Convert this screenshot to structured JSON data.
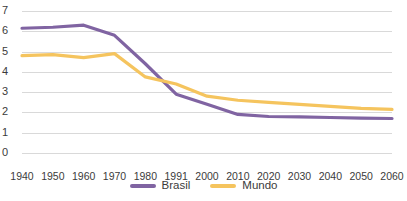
{
  "chart_data": {
    "type": "line",
    "title": "",
    "xlabel": "",
    "ylabel": "",
    "x": [
      "1940",
      "1950",
      "1960",
      "1970",
      "1980",
      "1991",
      "2000",
      "2010",
      "2020",
      "2030",
      "2040",
      "2050",
      "2060"
    ],
    "categories": [
      "1940",
      "1950",
      "1960",
      "1970",
      "1980",
      "1991",
      "2000",
      "2010",
      "2020",
      "2030",
      "2040",
      "2050",
      "2060"
    ],
    "ylim": [
      0,
      7
    ],
    "yticks": [
      "0",
      "1",
      "2",
      "3",
      "4",
      "5",
      "6",
      "7"
    ],
    "grid": true,
    "legend_position": "bottom",
    "series": [
      {
        "name": "Brasil",
        "color": "#8064a2",
        "values": [
          6.15,
          6.2,
          6.3,
          5.8,
          4.4,
          2.9,
          2.4,
          1.9,
          1.8,
          1.78,
          1.75,
          1.72,
          1.7
        ]
      },
      {
        "name": "Mundo",
        "color": "#f5c45e",
        "values": [
          4.8,
          4.85,
          4.7,
          4.9,
          3.75,
          3.4,
          2.8,
          2.6,
          2.5,
          2.4,
          2.3,
          2.2,
          2.15
        ]
      }
    ]
  },
  "legend": {
    "items": [
      {
        "label": "Brasil",
        "color": "#8064a2"
      },
      {
        "label": "Mundo",
        "color": "#f5c45e"
      }
    ]
  },
  "colors": {
    "brasil": "#8064a2",
    "mundo": "#f5c45e",
    "gridline": "#d9d9d9",
    "text": "#3b3b3b",
    "background": "#ffffff"
  }
}
